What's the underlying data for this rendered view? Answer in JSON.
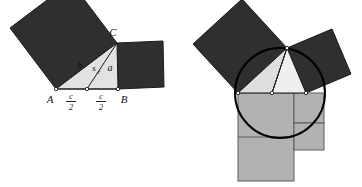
{
  "figure": {
    "colors": {
      "background": "#ffffff",
      "square_dark": "#2f2f2f",
      "triangle_light": "#e2e2e2",
      "triangle_light_alt": "#ededed",
      "rect_gray": "#b2b2b2",
      "outline": "#1a1a1a",
      "circle_stroke": "#000000",
      "text": "#111111"
    },
    "panels": [
      {
        "name": "left-panel",
        "description": "Triangle ABC with squares on sides a and b, median s_c to midpoint of AB",
        "labels": {
          "vertex_a": "A",
          "vertex_b": "B",
          "vertex_c": "C",
          "side_b": "b",
          "side_a": "a",
          "median": "s",
          "median_subscript": "c",
          "half_base_numerator": "c",
          "half_base_denominator": "2"
        }
      },
      {
        "name": "right-panel",
        "description": "Same triangle with circumcircle and gray equal-area rectangles below the base",
        "labels": {}
      }
    ]
  }
}
